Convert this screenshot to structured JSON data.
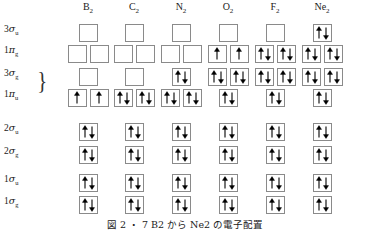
{
  "figure": {
    "caption": "図 2 ・ 7   B2 から Ne2 の電子配置",
    "caption_y": 219
  },
  "columns": [
    {
      "id": "B2",
      "label_main": "B",
      "label_sub": "2",
      "center_x": 88
    },
    {
      "id": "C2",
      "label_main": "C",
      "label_sub": "2",
      "center_x": 134
    },
    {
      "id": "N2",
      "label_main": "N",
      "label_sub": "2",
      "center_x": 181
    },
    {
      "id": "O2",
      "label_main": "O",
      "label_sub": "2",
      "center_x": 228
    },
    {
      "id": "F2",
      "label_main": "F",
      "label_sub": "2",
      "center_x": 275
    },
    {
      "id": "Ne2",
      "label_main": "Ne",
      "label_sub": "2",
      "center_x": 322
    }
  ],
  "box": {
    "width": 19,
    "height": 18,
    "pair_gap": 3,
    "border_color": "#8a8a8a",
    "fill_color": "#ffffff",
    "arrow_color": "#000000"
  },
  "brace": {
    "glyph": "}",
    "x": 36,
    "y": 68,
    "present": true
  },
  "rows": [
    {
      "id": "3sigma_u",
      "label_n": "3",
      "label_greek": "σ",
      "label_sub": "u",
      "label_y": 31,
      "box_y": 24,
      "slots_per_column": 1,
      "occupancy": {
        "B2": [
          0
        ],
        "C2": [
          0
        ],
        "N2": [
          0
        ],
        "O2": [
          0
        ],
        "F2": [
          0
        ],
        "Ne2": [
          2
        ]
      }
    },
    {
      "id": "1pi_g",
      "label_n": "1",
      "label_greek": "π",
      "label_sub": "g",
      "label_y": 52,
      "box_y": 45,
      "slots_per_column": 2,
      "occupancy": {
        "B2": [
          0,
          0
        ],
        "C2": [
          0,
          0
        ],
        "N2": [
          0,
          0
        ],
        "O2": [
          1,
          1
        ],
        "F2": [
          2,
          2
        ],
        "Ne2": [
          2,
          2
        ]
      }
    },
    {
      "id": "3sigma_g",
      "label_n": "3",
      "label_greek": "σ",
      "label_sub": "g",
      "label_y": 75,
      "box_y": 68,
      "slots_per_column": 1,
      "occupancy": {
        "B2": [
          0
        ],
        "C2": [
          0
        ],
        "N2": [
          2
        ],
        "O2": null,
        "F2": null,
        "Ne2": null
      }
    },
    {
      "id": "1pi_u",
      "label_n": "1",
      "label_greek": "π",
      "label_sub": "u",
      "label_y": 96,
      "box_y": 89,
      "slots_per_column": 2,
      "occupancy": {
        "B2": [
          1,
          1
        ],
        "C2": [
          2,
          2
        ],
        "N2": [
          2,
          2
        ],
        "O2": null,
        "F2": null,
        "Ne2": null
      }
    },
    {
      "id": "2sigma_u",
      "label_n": "2",
      "label_greek": "σ",
      "label_sub": "u",
      "label_y": 130,
      "box_y": 123,
      "slots_per_column": 1,
      "occupancy": {
        "B2": [
          2
        ],
        "C2": [
          2
        ],
        "N2": [
          2
        ],
        "O2": [
          2
        ],
        "F2": [
          2
        ],
        "Ne2": [
          2
        ]
      }
    },
    {
      "id": "2sigma_g",
      "label_n": "2",
      "label_greek": "σ",
      "label_sub": "g",
      "label_y": 153,
      "box_y": 146,
      "slots_per_column": 1,
      "occupancy": {
        "B2": [
          2
        ],
        "C2": [
          2
        ],
        "N2": [
          2
        ],
        "O2": [
          2
        ],
        "F2": [
          2
        ],
        "Ne2": [
          2
        ]
      }
    },
    {
      "id": "1sigma_u",
      "label_n": "1",
      "label_greek": "σ",
      "label_sub": "u",
      "label_y": 181,
      "box_y": 174,
      "slots_per_column": 1,
      "occupancy": {
        "B2": [
          2
        ],
        "C2": [
          2
        ],
        "N2": [
          2
        ],
        "O2": [
          2
        ],
        "F2": [
          2
        ],
        "Ne2": [
          2
        ]
      }
    },
    {
      "id": "1sigma_g",
      "label_n": "1",
      "label_greek": "σ",
      "label_sub": "g",
      "label_y": 203,
      "box_y": 196,
      "slots_per_column": 1,
      "occupancy": {
        "B2": [
          2
        ],
        "C2": [
          2
        ],
        "N2": [
          2
        ],
        "O2": [
          2
        ],
        "F2": [
          2
        ],
        "Ne2": [
          2
        ]
      }
    }
  ],
  "crossover_columns": {
    "note_columns": [
      "O2",
      "F2",
      "Ne2"
    ],
    "upper_row_id": "1pi_u",
    "upper_row_slots": 2,
    "upper_row_box_y": 68,
    "lower_row_id": "3sigma_g",
    "lower_row_slots": 1,
    "lower_row_box_y": 89,
    "occupancy_upper": {
      "O2": [
        2,
        2
      ],
      "F2": [
        2,
        2
      ],
      "Ne2": [
        2,
        2
      ]
    },
    "occupancy_lower": {
      "O2": [
        2
      ],
      "F2": [
        2
      ],
      "Ne2": [
        2
      ]
    }
  }
}
